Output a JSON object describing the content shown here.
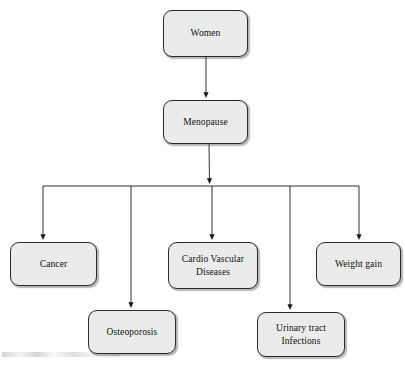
{
  "diagram": {
    "type": "flowchart",
    "orientation": "top-down",
    "canvas": {
      "width": 405,
      "height": 365
    },
    "colors": {
      "node_fill": "#ebebeb",
      "node_border": "#2b2b2b",
      "connector": "#1a1a1a",
      "text": "#101010",
      "background": "#ffffff"
    },
    "nodes": [
      {
        "id": "women",
        "label": "Women",
        "level": 0,
        "x": 163,
        "y": 10,
        "w": 85,
        "h": 47
      },
      {
        "id": "menopause",
        "label": "Menopause",
        "level": 1,
        "x": 163,
        "y": 100,
        "w": 85,
        "h": 44
      },
      {
        "id": "cancer",
        "label": "Cancer",
        "level": 2,
        "x": 10,
        "y": 242,
        "w": 87,
        "h": 44
      },
      {
        "id": "osteoporosis",
        "label": "Osteoporosis",
        "level": 2,
        "x": 88,
        "y": 310,
        "w": 88,
        "h": 44
      },
      {
        "id": "cardio-vascular-diseases",
        "label": "Cardio Vascular\nDiseases",
        "level": 2,
        "x": 168,
        "y": 242,
        "w": 90,
        "h": 47
      },
      {
        "id": "urinary-tract-infections",
        "label": "Urinary tract\nInfections",
        "level": 2,
        "x": 257,
        "y": 312,
        "w": 88,
        "h": 45
      },
      {
        "id": "weight-gain",
        "label": "Weight gain",
        "level": 2,
        "x": 316,
        "y": 242,
        "w": 85,
        "h": 44
      }
    ],
    "connectors": [
      {
        "id": "women-to-menopause",
        "from": "women",
        "to": "menopause",
        "kind": "straight-arrow"
      },
      {
        "id": "menopause-to-bus",
        "from": "menopause",
        "to": "branch-bus",
        "kind": "straight-arrow"
      },
      {
        "id": "bus-to-cancer",
        "from": "branch-bus",
        "to": "cancer",
        "kind": "elbow-arrow"
      },
      {
        "id": "bus-to-osteoporosis",
        "from": "branch-bus",
        "to": "osteoporosis",
        "kind": "elbow-arrow"
      },
      {
        "id": "bus-to-cardio-vascular-diseases",
        "from": "branch-bus",
        "to": "cardio-vascular-diseases",
        "kind": "straight-arrow"
      },
      {
        "id": "bus-to-urinary-tract-infections",
        "from": "branch-bus",
        "to": "urinary-tract-infections",
        "kind": "elbow-arrow"
      },
      {
        "id": "bus-to-weight-gain",
        "from": "branch-bus",
        "to": "weight-gain",
        "kind": "elbow-arrow"
      }
    ],
    "branch_bus": {
      "id": "branch-bus",
      "y": 186,
      "x_start": 43,
      "x_end": 359,
      "drop_x": [
        43,
        131,
        212,
        290,
        359
      ]
    }
  }
}
